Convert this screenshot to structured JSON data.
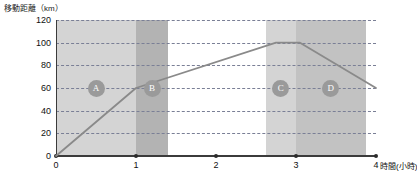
{
  "chart_data": {
    "type": "line",
    "title": "",
    "ylabel": "移動距離（km）",
    "xlabel": "時間（小時）",
    "xlabel_suffix": "時間(小時)",
    "ylim": [
      0,
      120
    ],
    "xlim": [
      0,
      4
    ],
    "grid": true,
    "legend": "none",
    "y_ticks": [
      "0",
      "20",
      "40",
      "60",
      "80",
      "100",
      "120"
    ],
    "y_tick_values": [
      0,
      20,
      40,
      60,
      80,
      100,
      120
    ],
    "x_ticks": [
      "0",
      "1",
      "2",
      "3",
      "4"
    ],
    "x_tick_values": [
      0,
      1,
      2,
      3,
      4
    ],
    "series": [
      {
        "name": "移動距離",
        "x": [
          0,
          1,
          2.75,
          3.05,
          4
        ],
        "values": [
          0,
          60,
          100,
          100,
          60
        ]
      }
    ],
    "bands": [
      {
        "label": "A",
        "x_start": 0.0,
        "x_end": 1.0,
        "color": "#d4d4d4",
        "label_y": 60
      },
      {
        "label": "B",
        "x_start": 1.0,
        "x_end": 1.4,
        "color": "#b3b3b3",
        "label_y": 60
      },
      {
        "label": "C",
        "x_start": 2.62,
        "x_end": 3.0,
        "color": "#d4d4d4",
        "label_y": 60
      },
      {
        "label": "D",
        "x_start": 3.0,
        "x_end": 3.87,
        "color": "#c2c2c2",
        "label_y": 60
      }
    ],
    "colors": {
      "line": "#8a8a8a",
      "grid": "#7a7f96",
      "axis": "#3b3b3b",
      "badge": "#9a9a9a",
      "badge_text": "#ffffff",
      "background": "#ffffff"
    }
  }
}
